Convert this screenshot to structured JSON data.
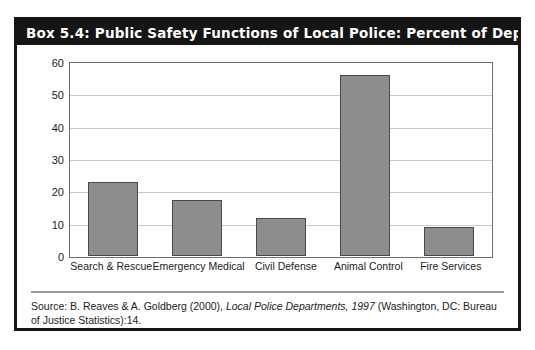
{
  "box": {
    "title": "Box 5.4: Public Safety Functions of Local Police: Percent of Departments",
    "title_bg": "#151515",
    "title_color": "#ffffff",
    "border_color": "#151515"
  },
  "source_note": {
    "prefix": "Source: B. Reaves & A. Goldberg (2000), ",
    "italic_1": "Local Police Departments, 1997",
    "suffix": " (Washington, DC: Bureau of Justice Statistics):14."
  },
  "chart_data": {
    "type": "bar",
    "title": "Box 5.4: Public Safety Functions of Local Police: Percent of Departments",
    "categories": [
      "Search & Rescue",
      "Emergency Medical",
      "Civil Defense",
      "Animal Control",
      "Fire Services"
    ],
    "values": [
      23,
      17.5,
      12,
      56.5,
      9
    ],
    "series": [
      {
        "name": "Percent of Departments",
        "values": [
          23,
          17.5,
          12,
          56.5,
          9
        ]
      }
    ],
    "xlabel": "",
    "ylabel": "",
    "ylim": [
      0,
      60
    ],
    "yticks": [
      0,
      10,
      20,
      30,
      40,
      50,
      60
    ],
    "ytick_labels": [
      "0",
      "10",
      "20",
      "30",
      "40",
      "50",
      "60"
    ],
    "grid": true,
    "grid_axis": "y",
    "legend": false,
    "legend_position": "none",
    "bar_fill": "#8d8d8d",
    "bar_edge": "#4a4a4a",
    "grid_color": "#c9c9c9",
    "frame_color": "#6e6e6e",
    "background": "#ffffff"
  }
}
